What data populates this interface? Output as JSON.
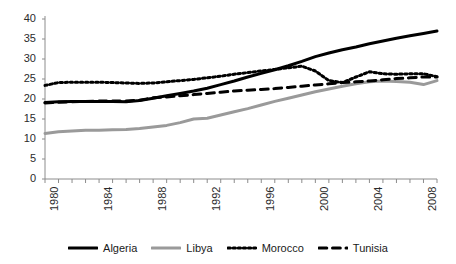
{
  "chart_data": {
    "type": "line",
    "title": "",
    "subtitle": "",
    "xlabel": "",
    "ylabel": "",
    "xlim": [
      1980,
      2009
    ],
    "ylim": [
      0,
      40
    ],
    "yticks": [
      0,
      5,
      10,
      15,
      20,
      25,
      30,
      35,
      40
    ],
    "xticks_labeled": [
      1980,
      1984,
      1988,
      1992,
      1996,
      2000,
      2004,
      2008
    ],
    "xticks_all": [
      1980,
      1981,
      1982,
      1983,
      1984,
      1985,
      1986,
      1987,
      1988,
      1989,
      1990,
      1991,
      1992,
      1993,
      1994,
      1995,
      1996,
      1997,
      1998,
      1999,
      2000,
      2001,
      2002,
      2003,
      2004,
      2005,
      2006,
      2007,
      2008,
      2009
    ],
    "grid": false,
    "legend_position": "bottom",
    "x": [
      1980,
      1981,
      1982,
      1983,
      1984,
      1985,
      1986,
      1987,
      1988,
      1989,
      1990,
      1991,
      1992,
      1993,
      1994,
      1995,
      1996,
      1997,
      1998,
      1999,
      2000,
      2001,
      2002,
      2003,
      2004,
      2005,
      2006,
      2007,
      2008,
      2009
    ],
    "series": [
      {
        "name": "Algeria",
        "color": "#000000",
        "style": "solid",
        "width": 3,
        "values": [
          19.1,
          19.3,
          19.4,
          19.4,
          19.4,
          19.4,
          19.3,
          19.6,
          20.2,
          20.8,
          21.4,
          22.0,
          22.7,
          23.6,
          24.5,
          25.5,
          26.4,
          27.3,
          28.3,
          29.4,
          30.6,
          31.5,
          32.3,
          33.0,
          33.8,
          34.5,
          35.2,
          35.8,
          36.4,
          37.0
        ]
      },
      {
        "name": "Libya",
        "color": "#9a9a9a",
        "style": "solid",
        "width": 3,
        "values": [
          11.4,
          11.8,
          12.0,
          12.2,
          12.2,
          12.3,
          12.4,
          12.6,
          13.0,
          13.4,
          14.1,
          15.0,
          15.2,
          16.0,
          16.8,
          17.6,
          18.5,
          19.4,
          20.2,
          21.0,
          21.8,
          22.5,
          23.2,
          23.8,
          24.3,
          24.5,
          24.4,
          24.2,
          23.6,
          24.6
        ]
      },
      {
        "name": "Morocco",
        "color": "#000000",
        "style": "dotted",
        "width": 3,
        "values": [
          23.4,
          24.1,
          24.2,
          24.2,
          24.2,
          24.1,
          24.0,
          23.9,
          24.0,
          24.3,
          24.6,
          24.9,
          25.3,
          25.7,
          26.2,
          26.6,
          27.0,
          27.4,
          27.8,
          28.2,
          27.0,
          24.6,
          24.1,
          25.5,
          26.8,
          26.3,
          26.2,
          26.3,
          26.3,
          25.6
        ]
      },
      {
        "name": "Tunisia",
        "color": "#000000",
        "style": "dashed",
        "width": 3,
        "values": [
          19.0,
          19.2,
          19.3,
          19.4,
          19.5,
          19.5,
          19.5,
          19.7,
          20.3,
          20.5,
          20.8,
          21.1,
          21.4,
          21.7,
          22.0,
          22.2,
          22.4,
          22.6,
          22.9,
          23.2,
          23.5,
          23.8,
          24.1,
          24.3,
          24.5,
          24.8,
          25.1,
          25.3,
          25.5,
          25.5
        ]
      }
    ]
  },
  "axes": {
    "ytick_labels": [
      "40",
      "35",
      "30",
      "25",
      "20",
      "15",
      "10",
      "5",
      "0"
    ],
    "xtick_labels": [
      "1980",
      "1984",
      "1988",
      "1992",
      "1996",
      "2000",
      "2004",
      "2008"
    ]
  },
  "legend": {
    "items": [
      {
        "label": "Algeria",
        "color": "#000000",
        "style": "solid"
      },
      {
        "label": "Libya",
        "color": "#9a9a9a",
        "style": "solid"
      },
      {
        "label": "Morocco",
        "color": "#000000",
        "style": "dotted"
      },
      {
        "label": "Tunisia",
        "color": "#000000",
        "style": "dashed"
      }
    ]
  },
  "colors": {
    "axis": "#8c8c8c",
    "text": "#2b2b2b",
    "background": "#ffffff",
    "algeria": "#000000",
    "libya": "#9a9a9a",
    "morocco": "#000000",
    "tunisia": "#000000"
  }
}
